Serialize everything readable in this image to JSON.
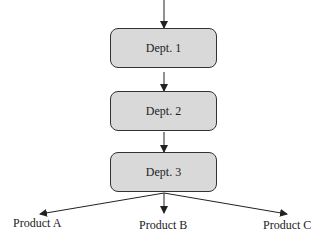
{
  "diagram": {
    "nodes": [
      {
        "id": "dept1",
        "label": "Dept. 1"
      },
      {
        "id": "dept2",
        "label": "Dept. 2"
      },
      {
        "id": "dept3",
        "label": "Dept. 3"
      }
    ],
    "outputs": [
      {
        "id": "productA",
        "label": "Product A"
      },
      {
        "id": "productB",
        "label": "Product B"
      },
      {
        "id": "productC",
        "label": "Product C"
      }
    ],
    "colors": {
      "box_fill": "#d9d9d9",
      "stroke": "#333333"
    }
  }
}
